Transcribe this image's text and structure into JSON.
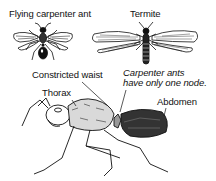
{
  "diagram": {
    "labels": {
      "flying_ant": "Flying carpenter ant",
      "termite": "Termite",
      "constricted_waist": "Constricted waist",
      "note_line1": "Carpenter ants",
      "note_line2": "have only one node.",
      "thorax": "Thorax",
      "abdomen": "Abdomen"
    },
    "colors": {
      "ink": "#111111",
      "background": "#ffffff"
    }
  }
}
